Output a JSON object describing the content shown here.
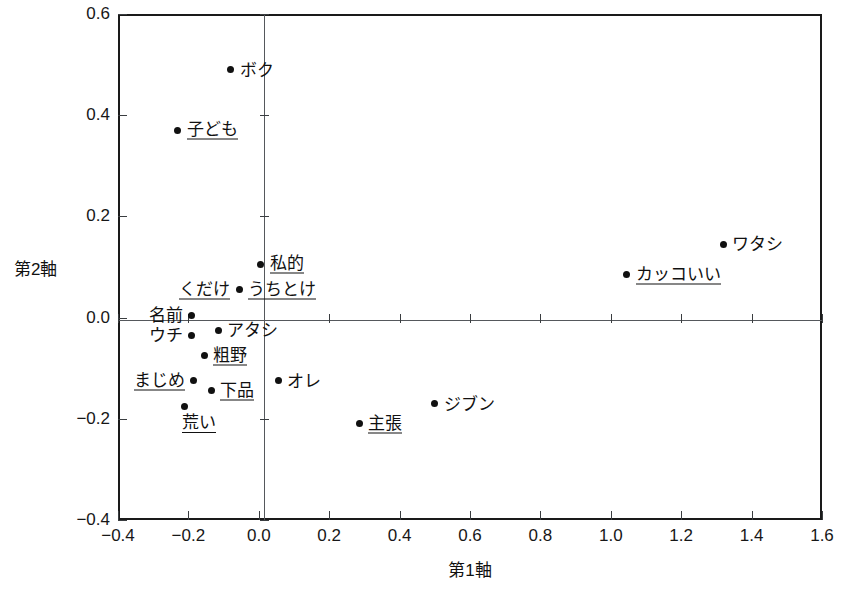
{
  "chart_data": {
    "type": "scatter",
    "title": "",
    "xlabel": "第1軸",
    "ylabel": "第2軸",
    "xlim": [
      -0.4,
      1.6
    ],
    "ylim": [
      -0.4,
      0.6
    ],
    "xticks": [
      "-0.4",
      "-0.2",
      "0.0",
      "0.2",
      "0.4",
      "0.6",
      "0.8",
      "1.0",
      "1.2",
      "1.4",
      "1.6"
    ],
    "xtick_values": [
      -0.4,
      -0.2,
      0.0,
      0.2,
      0.4,
      0.6,
      0.8,
      1.0,
      1.2,
      1.4,
      1.6
    ],
    "yticks": [
      "0.6",
      "0.4",
      "0.2",
      "0.0",
      "-0.2",
      "-0.4"
    ],
    "ytick_values": [
      0.6,
      0.4,
      0.2,
      0.0,
      -0.2,
      -0.4
    ],
    "grid": false,
    "legend": null,
    "zero_lines": true,
    "points": [
      {
        "label": "ボク",
        "x": -0.08,
        "y": 0.49,
        "underline": false,
        "label_pos": "right"
      },
      {
        "label": "子ども",
        "x": -0.23,
        "y": 0.37,
        "underline": true,
        "label_pos": "right"
      },
      {
        "label": "ワタシ",
        "x": 1.32,
        "y": 0.145,
        "underline": false,
        "label_pos": "right"
      },
      {
        "label": "カッコいい",
        "x": 1.045,
        "y": 0.085,
        "underline": true,
        "label_pos": "right"
      },
      {
        "label": "私的",
        "x": 0.005,
        "y": 0.105,
        "underline": true,
        "label_pos": "right"
      },
      {
        "label": "うちとけ",
        "x": -0.055,
        "y": 0.055,
        "underline": true,
        "label_pos": "right"
      },
      {
        "label": "くだけ",
        "x": -0.055,
        "y": 0.055,
        "underline": true,
        "label_pos": "left"
      },
      {
        "label": "名前",
        "x": -0.19,
        "y": 0.005,
        "underline": false,
        "label_pos": "left"
      },
      {
        "label": "アタシ",
        "x": -0.115,
        "y": -0.025,
        "underline": false,
        "label_pos": "right"
      },
      {
        "label": "ウチ",
        "x": -0.19,
        "y": -0.035,
        "underline": false,
        "label_pos": "left"
      },
      {
        "label": "粗野",
        "x": -0.155,
        "y": -0.075,
        "underline": true,
        "label_pos": "right"
      },
      {
        "label": "まじめ",
        "x": -0.185,
        "y": -0.125,
        "underline": true,
        "label_pos": "left"
      },
      {
        "label": "オレ",
        "x": 0.055,
        "y": -0.125,
        "underline": false,
        "label_pos": "right"
      },
      {
        "label": "下品",
        "x": -0.135,
        "y": -0.145,
        "underline": true,
        "label_pos": "right"
      },
      {
        "label": "荒い",
        "x": -0.21,
        "y": -0.175,
        "underline": true,
        "label_pos": "below"
      },
      {
        "label": "主張",
        "x": 0.285,
        "y": -0.21,
        "underline": true,
        "label_pos": "right"
      },
      {
        "label": "ジブン",
        "x": 0.5,
        "y": -0.17,
        "underline": false,
        "label_pos": "right"
      }
    ]
  },
  "colors": {
    "frame": "#1a1a1a",
    "zero_line": "#55585c",
    "point": "#111111",
    "text": "#111111",
    "background": "#ffffff"
  }
}
